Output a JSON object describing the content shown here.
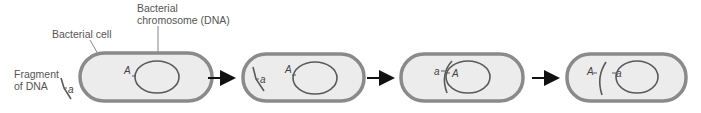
{
  "labels": {
    "chromosome_line1": "Bacterial",
    "chromosome_line2": "chromosome (DNA)",
    "cell": "Bacterial cell",
    "fragment_line1": "Fragment",
    "fragment_line2": "of DNA"
  },
  "alleles": {
    "upper": "A",
    "lower": "a"
  },
  "colors": {
    "cell_outline": "#8a8a8a",
    "cell_fill": "#ececec",
    "dna_stroke": "#5a5a5a",
    "arrow": "#111111",
    "text": "#555555"
  },
  "steps": [
    {
      "step": 1,
      "fragment_position": "outside cell"
    },
    {
      "step": 2,
      "fragment_position": "inside cell"
    },
    {
      "step": 3,
      "fragment_position": "paired with chromosome"
    },
    {
      "step": 4,
      "fragment_position": "recombined, a in chromosome"
    }
  ]
}
